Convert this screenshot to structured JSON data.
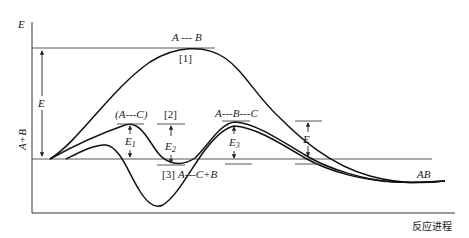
{
  "diagram": {
    "title": "",
    "axes": {
      "y_label": "E",
      "x_label": "反应进程",
      "reactant_label": "A+B"
    },
    "energy_labels": {
      "left_E": "E",
      "right_E": "E",
      "E1_main": "E",
      "E1_sub": "1",
      "E2_main": "E",
      "E2_sub": "2",
      "E3_main": "E",
      "E3_sub": "3"
    },
    "curves": [
      {
        "id": "1",
        "label": "[1]",
        "transition_state": "A---B"
      },
      {
        "id": "2",
        "label": "[2]",
        "intermediate_1": "(A---C)",
        "transition_state": "A---B---C"
      },
      {
        "id": "3",
        "label": "[3]",
        "intermediate": "A---C+B"
      }
    ],
    "product_label": "AB",
    "labels": {
      "ts1": "A --- B",
      "curve1_tag": "[1]",
      "ac_complex": "(A---C)",
      "curve2_tag": "[2]",
      "abc_complex": "A---B---C",
      "curve3_tag": "[3]",
      "ac_plus_b": "A---C+B",
      "product": "AB"
    },
    "colors": {
      "line": "#111111",
      "background": "#ffffff"
    }
  }
}
